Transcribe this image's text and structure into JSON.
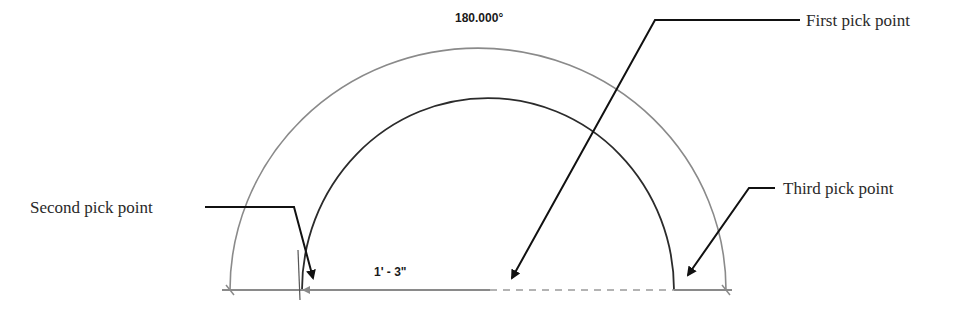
{
  "diagram": {
    "angle_dimension": "180.000°",
    "radius_dimension": "1' - 3\"",
    "callouts": {
      "first": "First pick point",
      "second": "Second pick point",
      "third": "Third pick point"
    }
  },
  "colors": {
    "outer_arc": "#8a8a8a",
    "inner_arc": "#2b2b2b",
    "leader": "#111111",
    "baseline": "#8a8a8a"
  }
}
